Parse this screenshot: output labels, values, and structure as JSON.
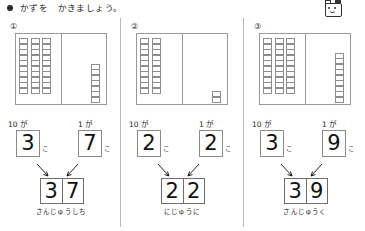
{
  "header": {
    "title": "かずを　かきましょう。",
    "bullet_icon": "filled-circle-icon",
    "mascot_icon": "mascot-face-icon"
  },
  "labels": {
    "tens_label": "10 が",
    "ones_label": "1 が",
    "counter": "こ"
  },
  "panels": [
    {
      "number": "①",
      "tens_rods": 3,
      "ones_cubes": 7,
      "cells_per_rod": 10,
      "tens_digit": "3",
      "ones_digit": "7",
      "result_first": "3",
      "result_second": "7",
      "result_value": "37",
      "reading": "さんじゅうしち"
    },
    {
      "number": "②",
      "tens_rods": 2,
      "ones_cubes": 2,
      "cells_per_rod": 10,
      "tens_digit": "2",
      "ones_digit": "2",
      "result_first": "2",
      "result_second": "2",
      "result_value": "22",
      "reading": "にじゅうに"
    },
    {
      "number": "③",
      "tens_rods": 3,
      "ones_cubes": 9,
      "cells_per_rod": 10,
      "tens_digit": "3",
      "ones_digit": "9",
      "result_first": "3",
      "result_second": "9",
      "result_value": "39",
      "reading": "さんじゅうく"
    }
  ],
  "colors": {
    "ink": "#1a1a1a",
    "rule": "#9a9a9a",
    "box_border": "#8a8a8a",
    "paper": "#ffffff"
  }
}
